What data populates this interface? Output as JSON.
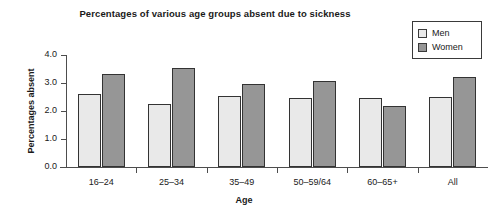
{
  "chart_data": {
    "type": "bar",
    "title": "Percentages of various age groups absent due to sickness",
    "xlabel": "Age",
    "ylabel": "Percentages absent",
    "categories": [
      "16–24",
      "25–34",
      "35–49",
      "50–59/64",
      "60–65+",
      "All"
    ],
    "series": [
      {
        "name": "Men",
        "color": "#e9e9e9",
        "values": [
          2.6,
          2.25,
          2.55,
          2.45,
          2.47,
          2.5
        ]
      },
      {
        "name": "Women",
        "color": "#969696",
        "values": [
          3.33,
          3.53,
          2.97,
          3.07,
          2.18,
          3.2
        ]
      }
    ],
    "ylim": [
      0.0,
      4.0
    ],
    "ytick_labels": [
      "0.0",
      "1.0",
      "2.0",
      "3.0",
      "4.0"
    ],
    "ytick_values": [
      0.0,
      1.0,
      2.0,
      3.0,
      4.0
    ],
    "grid": false,
    "legend_position": "top-right"
  },
  "legend": {
    "entries": [
      {
        "label": "Men",
        "swatch": "light-gray-swatch-icon"
      },
      {
        "label": "Women",
        "swatch": "dark-gray-swatch-icon"
      }
    ]
  }
}
